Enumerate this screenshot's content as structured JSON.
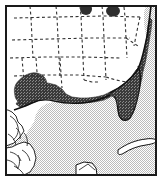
{
  "figure": {
    "name": "distribution-range-map",
    "region_description": "Southeastern United States, Gulf of Mexico and Caribbean",
    "frame": {
      "stroke_color": "#1a1a1a",
      "stroke_width": 2,
      "x": 5,
      "y": 5,
      "width": 152,
      "height": 171
    },
    "colors": {
      "land": "#ffffff",
      "ocean": "#d9d9d9",
      "range_shading": "#4a4a4a",
      "border_line": "#1a1a1a",
      "state_border": "#333333",
      "coastline": "#111111"
    },
    "legend_items": [
      {
        "key": "range",
        "label": "range",
        "swatch": "#4a4a4a"
      },
      {
        "key": "ocean",
        "label": "water",
        "swatch": "#d9d9d9"
      },
      {
        "key": "land",
        "label": "land",
        "swatch": "#ffffff"
      }
    ],
    "features": {
      "state_borders_style": "dashed",
      "ocean_fill_style": "fine stipple dither",
      "range_fill_style": "coarse dark stipple"
    },
    "range_patches": [
      {
        "name": "gulf-coast-band",
        "location": "Texas to Florida Gulf coastline"
      },
      {
        "name": "florida-peninsula",
        "location": "Florida"
      },
      {
        "name": "texas-coastal-plain",
        "location": "southeast Texas"
      },
      {
        "name": "atlantic-coast-strip",
        "location": "Atlantic seaboard"
      },
      {
        "name": "great-lakes-patch-west",
        "location": "upper midwest"
      },
      {
        "name": "great-lakes-patch-east",
        "location": "lower great lakes"
      }
    ]
  }
}
